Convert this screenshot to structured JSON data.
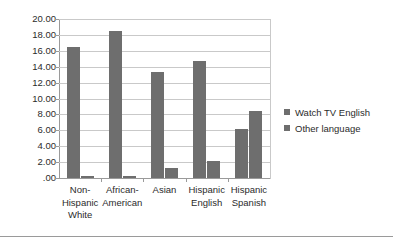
{
  "chart_data": {
    "type": "bar",
    "title": "",
    "xlabel": "",
    "ylabel": "",
    "ylim": [
      0,
      20
    ],
    "ytick_step": 2,
    "grid": true,
    "legend_position": "right",
    "categories": [
      "Non-\nHispanic\nWhite",
      "African-\nAmerican",
      "Asian",
      "Hispanic\nEnglish",
      "Hispanic\nSpanish"
    ],
    "ytick_labels": [
      "20.00",
      "18.00",
      "16.00",
      "14.00",
      "12.00",
      "10.00",
      "8.00",
      "6.00",
      "4.00",
      "2.00",
      ".00"
    ],
    "ytick_values": [
      20,
      18,
      16,
      14,
      12,
      10,
      8,
      6,
      4,
      2,
      0
    ],
    "series": [
      {
        "name": "Watch TV English",
        "color": "#6e6e6e",
        "values": [
          16.5,
          18.5,
          13.3,
          14.7,
          6.2
        ]
      },
      {
        "name": "Other language",
        "color": "#6e6e6e",
        "values": [
          0.2,
          0.3,
          1.3,
          2.1,
          8.4
        ]
      }
    ]
  },
  "colors": {
    "bar": "#6e6e6e",
    "gridline": "#c9c9c9",
    "axis": "#9a9a9a",
    "text": "#2b2b2b",
    "background": "#ffffff"
  }
}
